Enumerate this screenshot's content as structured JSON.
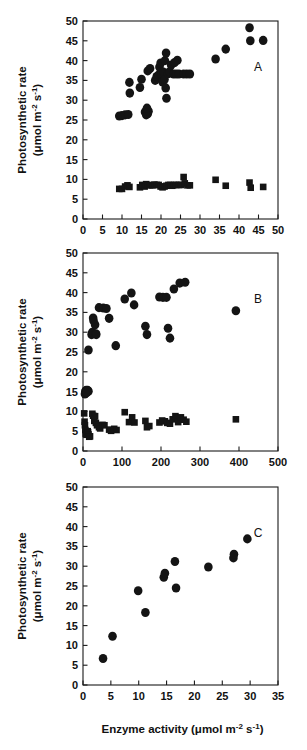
{
  "figure": {
    "background": "#ffffff",
    "marker_color": "#141414",
    "axis_color": "#1a1a1a",
    "x_axis_title": "Enzyme activity  (μmol   m⁻²   s⁻¹)",
    "x_axis_title_parts": {
      "name": "Enzyme activity",
      "open_paren": "(μmol",
      "unit_m": "m",
      "unit_m_sup": "-2",
      "unit_s": "s",
      "unit_s_sup": "-1",
      "close_paren": ")"
    },
    "y_axis_title_line1": "Photosynthetic  rate",
    "y_axis_title_line2_parts": {
      "open": "(μmol",
      "unit_m": "m",
      "unit_m_sup": "-2",
      "unit_s": "s",
      "unit_s_sup": "-1",
      "close": ")"
    },
    "y_axis_title_line2": "(μmol  m⁻²  s⁻¹)"
  },
  "chart_data": [
    {
      "type": "scatter",
      "panel": "A",
      "title": "",
      "xlabel": "Enzyme activity (μmol m-2 s-1)",
      "ylabel": "Photosynthetic rate (μmol m-2 s-1)",
      "xlim": [
        0,
        50
      ],
      "ylim": [
        0,
        50
      ],
      "xticks": [
        0,
        5,
        10,
        15,
        20,
        25,
        30,
        35,
        40,
        45,
        50
      ],
      "yticks": [
        0,
        5,
        10,
        15,
        20,
        25,
        30,
        35,
        40,
        45,
        50
      ],
      "grid": false,
      "legend": "none",
      "series": [
        {
          "name": "high-rate-circles",
          "marker": "circle",
          "points": [
            [
              9.3,
              26.0
            ],
            [
              10.0,
              26.1
            ],
            [
              10.8,
              26.3
            ],
            [
              11.6,
              26.4
            ],
            [
              11.9,
              34.5
            ],
            [
              12.0,
              31.8
            ],
            [
              14.6,
              33.2
            ],
            [
              15.0,
              35.3
            ],
            [
              15.9,
              27.0
            ],
            [
              16.2,
              26.3
            ],
            [
              16.3,
              27.5
            ],
            [
              16.6,
              26.6
            ],
            [
              16.8,
              27.2
            ],
            [
              16.4,
              28.0
            ],
            [
              16.6,
              37.4
            ],
            [
              17.2,
              38.0
            ],
            [
              18.5,
              35.0
            ],
            [
              18.9,
              36.0
            ],
            [
              19.4,
              36.4
            ],
            [
              19.6,
              38.4
            ],
            [
              19.9,
              39.4
            ],
            [
              20.1,
              36.5
            ],
            [
              20.4,
              34.6
            ],
            [
              20.6,
              37.1
            ],
            [
              20.9,
              35.2
            ],
            [
              21.0,
              40.0
            ],
            [
              21.3,
              41.9
            ],
            [
              21.2,
              33.1
            ],
            [
              21.4,
              30.5
            ],
            [
              21.8,
              36.7
            ],
            [
              22.2,
              37.2
            ],
            [
              22.6,
              38.9
            ],
            [
              23.2,
              36.6
            ],
            [
              23.9,
              36.6
            ],
            [
              24.6,
              36.6
            ],
            [
              24.2,
              40.1
            ],
            [
              23.5,
              39.5
            ],
            [
              25.8,
              36.6
            ],
            [
              26.6,
              36.6
            ],
            [
              27.4,
              36.6
            ],
            [
              34.0,
              40.4
            ],
            [
              36.6,
              42.9
            ],
            [
              42.7,
              48.3
            ],
            [
              42.9,
              45.0
            ],
            [
              46.2,
              45.1
            ]
          ]
        },
        {
          "name": "low-rate-squares",
          "marker": "square",
          "points": [
            [
              9.3,
              7.6
            ],
            [
              10.0,
              7.6
            ],
            [
              10.8,
              8.2
            ],
            [
              11.4,
              8.5
            ],
            [
              11.9,
              8.1
            ],
            [
              14.6,
              8.0
            ],
            [
              15.2,
              8.6
            ],
            [
              15.8,
              8.2
            ],
            [
              16.2,
              8.8
            ],
            [
              16.6,
              8.6
            ],
            [
              17.2,
              8.5
            ],
            [
              17.8,
              8.5
            ],
            [
              18.3,
              8.7
            ],
            [
              18.9,
              8.6
            ],
            [
              19.4,
              8.6
            ],
            [
              19.9,
              8.2
            ],
            [
              20.4,
              8.0
            ],
            [
              20.9,
              8.2
            ],
            [
              21.4,
              8.4
            ],
            [
              21.9,
              8.6
            ],
            [
              22.4,
              8.6
            ],
            [
              22.9,
              8.4
            ],
            [
              23.4,
              8.6
            ],
            [
              23.9,
              8.6
            ],
            [
              24.6,
              8.6
            ],
            [
              25.2,
              8.6
            ],
            [
              25.8,
              10.6
            ],
            [
              26.1,
              9.0
            ],
            [
              26.8,
              8.5
            ],
            [
              27.4,
              8.5
            ],
            [
              34.0,
              9.9
            ],
            [
              36.6,
              8.4
            ],
            [
              42.7,
              9.2
            ],
            [
              43.0,
              7.9
            ],
            [
              46.2,
              8.1
            ]
          ]
        }
      ]
    },
    {
      "type": "scatter",
      "panel": "B",
      "title": "",
      "xlabel": "Enzyme activity (μmol m-2 s-1)",
      "ylabel": "Photosynthetic rate (μmol m-2 s-1)",
      "xlim": [
        0,
        500
      ],
      "ylim": [
        0,
        50
      ],
      "xticks": [
        0,
        100,
        200,
        300,
        400,
        500
      ],
      "yticks": [
        0,
        5,
        10,
        15,
        20,
        25,
        30,
        35,
        40,
        45,
        50
      ],
      "grid": false,
      "legend": "none",
      "series": [
        {
          "name": "high-rate-circles",
          "marker": "circle",
          "points": [
            [
              5,
              14.4
            ],
            [
              6,
              15.1
            ],
            [
              8,
              15.3
            ],
            [
              9,
              14.7
            ],
            [
              11,
              15.2
            ],
            [
              12,
              15.3
            ],
            [
              14,
              15.1
            ],
            [
              10,
              14.9
            ],
            [
              14,
              25.5
            ],
            [
              22,
              29.4
            ],
            [
              24,
              30.0
            ],
            [
              26,
              33.6
            ],
            [
              27,
              32.9
            ],
            [
              31,
              31.9
            ],
            [
              33,
              29.6
            ],
            [
              34,
              29.4
            ],
            [
              41,
              36.2
            ],
            [
              52,
              36.1
            ],
            [
              60,
              36.0
            ],
            [
              67,
              33.5
            ],
            [
              84,
              26.6
            ],
            [
              107,
              38.4
            ],
            [
              124,
              39.9
            ],
            [
              131,
              36.9
            ],
            [
              160,
              31.5
            ],
            [
              164,
              29.4
            ],
            [
              196,
              38.9
            ],
            [
              205,
              38.8
            ],
            [
              214,
              38.8
            ],
            [
              218,
              31.0
            ],
            [
              223,
              28.5
            ],
            [
              233,
              40.9
            ],
            [
              248,
              42.4
            ],
            [
              262,
              42.6
            ],
            [
              392,
              35.4
            ]
          ]
        },
        {
          "name": "low-rate-squares",
          "marker": "square",
          "points": [
            [
              3,
              9.5
            ],
            [
              4,
              7.4
            ],
            [
              5,
              6.5
            ],
            [
              6,
              5.3
            ],
            [
              7,
              4.3
            ],
            [
              8,
              4.6
            ],
            [
              9,
              4.1
            ],
            [
              11,
              4.4
            ],
            [
              12,
              5.0
            ],
            [
              13,
              4.7
            ],
            [
              14,
              4.2
            ],
            [
              16,
              3.6
            ],
            [
              18,
              3.7
            ],
            [
              24,
              9.4
            ],
            [
              26,
              8.9
            ],
            [
              29,
              7.6
            ],
            [
              31,
              8.8
            ],
            [
              33,
              7.1
            ],
            [
              36,
              6.5
            ],
            [
              41,
              6.0
            ],
            [
              44,
              5.7
            ],
            [
              50,
              6.6
            ],
            [
              55,
              6.5
            ],
            [
              67,
              5.4
            ],
            [
              72,
              5.1
            ],
            [
              80,
              5.6
            ],
            [
              86,
              5.3
            ],
            [
              107,
              9.8
            ],
            [
              118,
              7.3
            ],
            [
              126,
              8.5
            ],
            [
              132,
              7.2
            ],
            [
              160,
              7.6
            ],
            [
              164,
              6.0
            ],
            [
              170,
              6.3
            ],
            [
              196,
              7.2
            ],
            [
              203,
              7.7
            ],
            [
              210,
              7.5
            ],
            [
              216,
              7.1
            ],
            [
              223,
              6.9
            ],
            [
              230,
              8.0
            ],
            [
              237,
              8.8
            ],
            [
              244,
              7.3
            ],
            [
              251,
              8.5
            ],
            [
              258,
              7.9
            ],
            [
              265,
              7.4
            ],
            [
              392,
              8.0
            ]
          ]
        }
      ]
    },
    {
      "type": "scatter",
      "panel": "C",
      "title": "",
      "xlabel": "Enzyme activity (μmol m-2 s-1)",
      "ylabel": "Photosynthetic rate (μmol m-2 s-1)",
      "xlim": [
        0,
        35
      ],
      "ylim": [
        0,
        50
      ],
      "xticks": [
        0,
        5,
        10,
        15,
        20,
        25,
        30,
        35
      ],
      "yticks": [
        0,
        5,
        10,
        15,
        20,
        25,
        30,
        35,
        40,
        45,
        50
      ],
      "grid": false,
      "legend": "none",
      "series": [
        {
          "name": "rate-circles",
          "marker": "circle",
          "points": [
            [
              3.6,
              6.7
            ],
            [
              5.3,
              12.3
            ],
            [
              9.9,
              23.8
            ],
            [
              11.2,
              18.3
            ],
            [
              14.5,
              27.2
            ],
            [
              14.7,
              28.2
            ],
            [
              16.5,
              31.2
            ],
            [
              16.7,
              24.5
            ],
            [
              22.5,
              29.8
            ],
            [
              27.0,
              32.1
            ],
            [
              27.1,
              33.0
            ],
            [
              29.5,
              36.9
            ]
          ]
        }
      ]
    }
  ],
  "panels": [
    {
      "id": "A",
      "label": "A"
    },
    {
      "id": "B",
      "label": "B"
    },
    {
      "id": "C",
      "label": "C"
    }
  ]
}
